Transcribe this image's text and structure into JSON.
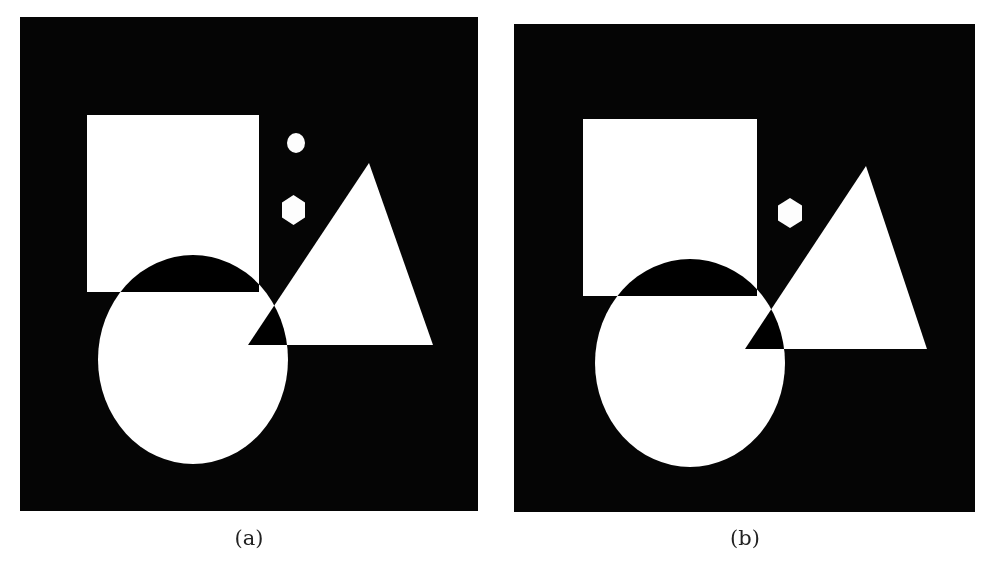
{
  "figure": {
    "background_color": "#ffffff",
    "panel_color": "#050505",
    "shape_color": "#ffffff",
    "composition": "XOR of white shapes on black background"
  },
  "panels": [
    {
      "id": "a",
      "caption": "(a)",
      "frame": {
        "x": 20,
        "y": 17,
        "width": 458,
        "height": 494
      },
      "shapes": {
        "square": {
          "x": 87,
          "y": 115,
          "width": 172,
          "height": 177
        },
        "ellipse": {
          "cx": 193,
          "cy": 359.5,
          "rx": 95,
          "ry": 104.5
        },
        "triangle": {
          "points": [
            [
              369,
              163
            ],
            [
              248,
              345
            ],
            [
              433,
              345
            ]
          ]
        },
        "oval_dot": {
          "cx": 296,
          "cy": 143,
          "rx": 9,
          "ry": 10
        },
        "hexagon": {
          "cx": 293.5,
          "cy": 210,
          "half_width": 11.5,
          "half_height": 15
        }
      }
    },
    {
      "id": "b",
      "caption": "(b)",
      "frame": {
        "x": 514,
        "y": 24,
        "width": 461,
        "height": 488
      },
      "shapes": {
        "square": {
          "x": 583,
          "y": 119,
          "width": 174,
          "height": 177
        },
        "ellipse": {
          "cx": 690,
          "cy": 363,
          "rx": 95,
          "ry": 104
        },
        "triangle": {
          "points": [
            [
              866,
              166
            ],
            [
              745,
              349
            ],
            [
              927,
              349
            ]
          ]
        },
        "hexagon": {
          "cx": 790,
          "cy": 213,
          "half_width": 12,
          "half_height": 15
        }
      }
    }
  ]
}
